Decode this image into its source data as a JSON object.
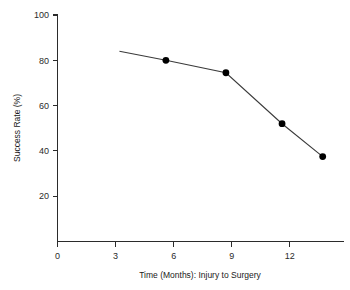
{
  "chart_data": {
    "type": "line",
    "title": "",
    "xlabel": "Time (Months): Injury to Surgery",
    "ylabel": "Success Rate (%)",
    "xlim": [
      0,
      14.8
    ],
    "ylim": [
      0,
      100
    ],
    "xticks": [
      "0",
      "3",
      "6",
      "9",
      "12"
    ],
    "xtick_values": [
      0,
      3,
      6,
      9,
      12
    ],
    "yticks": [
      "20",
      "40",
      "60",
      "80",
      "100"
    ],
    "ytick_values": [
      20,
      40,
      60,
      80,
      100
    ],
    "grid": false,
    "legend": "none",
    "series": [
      {
        "name": "Success Rate",
        "color": "#000000",
        "line_color": "#3a3a3a",
        "marker": "circle",
        "x": [
          3.2,
          5.6,
          8.7,
          11.6,
          13.7
        ],
        "values": [
          84,
          80,
          74.5,
          52,
          37.5
        ],
        "marker_shown": [
          false,
          true,
          true,
          true,
          true
        ]
      }
    ]
  },
  "axes": {
    "y_title": "Success Rate (%)",
    "x_title": "Time (Months): Injury to Surgery"
  },
  "colors": {
    "background": "#ffffff",
    "axis": "#2b2b2b",
    "line": "#3a3a3a",
    "marker": "#000000"
  }
}
